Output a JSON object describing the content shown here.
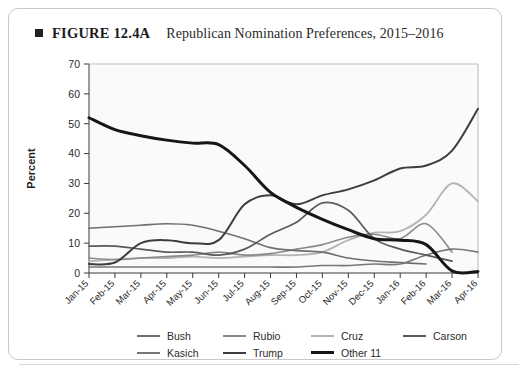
{
  "figure": {
    "marker_icon": "filled-square-icon",
    "label": "FIGURE 12.4A",
    "title": "Republican Nomination Preferences, 2015–2016"
  },
  "chart_data": {
    "type": "line",
    "title": "Republican Nomination Preferences, 2015–2016",
    "xlabel": "",
    "ylabel": "Percent",
    "ylim": [
      0,
      70
    ],
    "yticks": [
      0,
      10,
      20,
      30,
      40,
      50,
      60,
      70
    ],
    "grid": false,
    "legend_position": "bottom",
    "x": [
      "Jan-15",
      "Feb-15",
      "Mar-15",
      "Apr-15",
      "May-15",
      "Jun-15",
      "Jul-15",
      "Aug-15",
      "Sep-15",
      "Oct-15",
      "Nov-15",
      "Dec-15",
      "Jan-16",
      "Feb-16",
      "Mar-16",
      "Apr-16"
    ],
    "series": [
      {
        "name": "Bush",
        "color": "#6f6f6f",
        "width": 1.6,
        "values": [
          15,
          15.5,
          16,
          16.5,
          16,
          14,
          11.5,
          8.5,
          7.5,
          7,
          5,
          4,
          3.5,
          3,
          null,
          null
        ]
      },
      {
        "name": "Rubio",
        "color": "#8a8a8a",
        "width": 1.6,
        "values": [
          5,
          4.5,
          5,
          5.5,
          6,
          7,
          6,
          6.5,
          8,
          9.5,
          12,
          13,
          11.5,
          16.5,
          7,
          null
        ]
      },
      {
        "name": "Cruz",
        "color": "#b4b4b4",
        "width": 1.8,
        "values": [
          4,
          4.5,
          5,
          5,
          5.5,
          5,
          5.5,
          6,
          6,
          7,
          11,
          13.5,
          14,
          19.5,
          30,
          24
        ]
      },
      {
        "name": "Carson",
        "color": "#5a5a5a",
        "width": 1.7,
        "values": [
          9,
          9,
          8,
          7,
          7,
          6,
          8,
          13,
          17,
          23.5,
          21,
          11.5,
          8,
          6,
          4,
          null
        ]
      },
      {
        "name": "Kasich",
        "color": "#777777",
        "width": 1.6,
        "values": [
          2,
          2,
          2,
          2,
          2,
          2,
          2,
          2,
          2,
          2.5,
          2.5,
          3,
          3,
          6,
          8,
          7
        ]
      },
      {
        "name": "Trump",
        "color": "#3d3d3d",
        "width": 2.0,
        "values": [
          3,
          3.5,
          10,
          11,
          10,
          11,
          23,
          26,
          23,
          26,
          28,
          31,
          35,
          36,
          41,
          55
        ]
      },
      {
        "name": "Other 11",
        "color": "#161616",
        "width": 3.0,
        "values": [
          52,
          48,
          46,
          44.5,
          43.5,
          43,
          36,
          27,
          22,
          18,
          14.5,
          11.5,
          11,
          9.5,
          0.7,
          0.5
        ]
      }
    ],
    "legend_rows": [
      [
        "Bush",
        "Rubio",
        "Cruz",
        "Carson"
      ],
      [
        "Kasich",
        "Trump",
        "Other 11"
      ]
    ]
  },
  "axis": {
    "y_label": "Percent",
    "y_ticks": [
      "0",
      "10",
      "20",
      "30",
      "40",
      "50",
      "60",
      "70"
    ],
    "x_ticks": [
      "Jan-15",
      "Feb-15",
      "Mar-15",
      "Apr-15",
      "May-15",
      "Jun-15",
      "Jul-15",
      "Aug-15",
      "Sep-15",
      "Oct-15",
      "Nov-15",
      "Dec-15",
      "Jan-16",
      "Feb-16",
      "Mar-16",
      "Apr-16"
    ]
  }
}
